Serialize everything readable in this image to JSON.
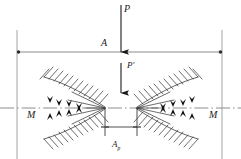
{
  "figure": {
    "type": "engineering-slip-line-field-diagram",
    "width": 241,
    "height": 159,
    "background": "#ffffff",
    "stroke_color": "#4a4a4a",
    "dark_stroke_color": "#1a1a1a",
    "line_color_light": "#8c8c8c"
  },
  "labels": {
    "applied_load": "P",
    "reaction_load": "P′",
    "section_A": "A",
    "moment_left": "M",
    "moment_right": "M",
    "dimension_ap": "A",
    "dimension_ap_sub": "p"
  },
  "arrows": {
    "P": {
      "x": 121,
      "y_start": 5,
      "y_end": 52,
      "direction": "down",
      "label": "P"
    },
    "P_prime": {
      "x": 121,
      "y_start": 63,
      "y_end": 92,
      "direction": "down",
      "label": "P′"
    }
  },
  "geometry": {
    "top_horizontal_line_y": 52,
    "centerline_y": 108,
    "left_vertical_x": 17,
    "right_vertical_x": 222,
    "dimension_line_y": 127,
    "fan_center_left_x": 105,
    "fan_center_right_x": 137,
    "dimension_ticks_x": [
      105,
      137
    ]
  },
  "field": {
    "description": "Symmetric slip-line (hatched fan) plastic zone beneath punch with bold shear arrows",
    "left_fan_vertex_x": 105,
    "right_fan_vertex_x": 137,
    "bold_arrow_clusters": [
      "upper-left",
      "lower-left",
      "upper-right",
      "lower-right"
    ]
  }
}
